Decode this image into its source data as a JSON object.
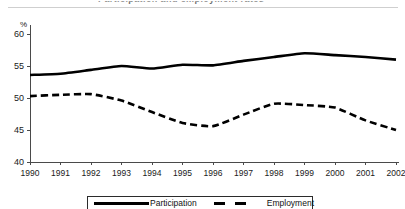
{
  "title_remnant": "Participation and employment rates",
  "chart_data": {
    "type": "line",
    "title": "",
    "xlabel": "",
    "ylabel": "%",
    "ylim": [
      40,
      60
    ],
    "yticks": [
      40,
      45,
      50,
      55,
      60
    ],
    "grid": false,
    "legend_position": "bottom-center",
    "categories": [
      "1990",
      "1991",
      "1992",
      "1993",
      "1994",
      "1995",
      "1996",
      "1997",
      "1998",
      "1999",
      "2000",
      "2001",
      "2002"
    ],
    "series": [
      {
        "name": "Participation",
        "style": "solid",
        "color": "#000000",
        "values": [
          53.6,
          53.8,
          54.4,
          55.0,
          54.6,
          55.2,
          55.1,
          55.8,
          56.4,
          57.0,
          56.7,
          56.4,
          56.0
        ]
      },
      {
        "name": "Employment",
        "style": "dashed",
        "color": "#000000",
        "values": [
          50.3,
          50.5,
          50.6,
          49.6,
          47.8,
          46.1,
          45.6,
          47.4,
          49.1,
          48.9,
          48.5,
          46.5,
          45.0
        ]
      }
    ]
  },
  "legend": {
    "items": [
      {
        "label": "Participation"
      },
      {
        "label": "Employment"
      }
    ]
  }
}
